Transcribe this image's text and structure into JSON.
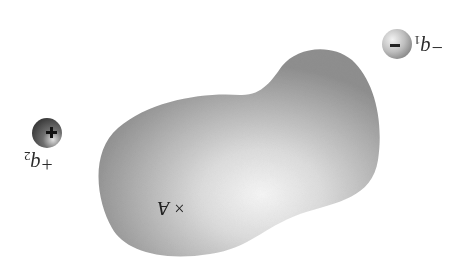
{
  "diagram": {
    "orientation": "rotated 180 degrees",
    "region": {
      "name": "charge distribution blob",
      "fill_edge": "#9a9a9a",
      "fill_center": "#f4f4f4"
    },
    "charges": [
      {
        "id": "q1",
        "sign": "-",
        "symbol": "−",
        "label": "−q",
        "subscript": "1",
        "cx": 397,
        "cy": 44,
        "r": 15
      },
      {
        "id": "q2",
        "sign": "+",
        "symbol": "+",
        "label": "+q",
        "subscript": "2",
        "cx": 47,
        "cy": 133,
        "r": 15
      }
    ],
    "point": {
      "marker": "×",
      "label": "A",
      "x": 190,
      "y": 210
    }
  }
}
